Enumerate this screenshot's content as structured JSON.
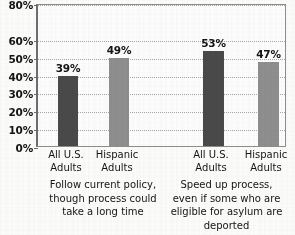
{
  "chart_data": {
    "type": "bar",
    "title": "",
    "subtitle": "",
    "xlabel": "",
    "ylabel": "",
    "ylim": [
      0,
      80
    ],
    "grid": true,
    "grid_style": "dotted-horizontal",
    "legend_position": "none",
    "value_suffix": "%",
    "categories": [
      "All U.S. Adults",
      "Hispanic Adults",
      "All U.S. Adults",
      "Hispanic Adults"
    ],
    "values": [
      39,
      49,
      53,
      47
    ],
    "bar_colors": [
      "#4a4a4a",
      "#8f8f8f",
      "#4a4a4a",
      "#8f8f8f"
    ],
    "data_labels": [
      "39%",
      "49%",
      "53%",
      "47%"
    ],
    "ytick_values": [
      0,
      10,
      20,
      30,
      40,
      50,
      60,
      80
    ],
    "ytick_labels": [
      "0%",
      "10%",
      "20%",
      "30%",
      "40%",
      "50%",
      "60%",
      "80%"
    ],
    "groups": [
      {
        "caption_lines": [
          "Follow current policy,",
          "though process could",
          "take a long time"
        ],
        "series": [
          {
            "name": "All U.S. Adults",
            "value": 39
          },
          {
            "name": "Hispanic Adults",
            "value": 49
          }
        ]
      },
      {
        "caption_lines": [
          "Speed up process,",
          "even if some who are",
          "eligible for asylum are",
          "deported"
        ],
        "series": [
          {
            "name": "All U.S. Adults",
            "value": 53
          },
          {
            "name": "Hispanic Adults",
            "value": 47
          }
        ]
      }
    ]
  },
  "axis": {
    "ticks": [
      {
        "label": "80%",
        "value": 80
      },
      {
        "label": "60%",
        "value": 60
      },
      {
        "label": "50%",
        "value": 50
      },
      {
        "label": "40%",
        "value": 40
      },
      {
        "label": "30%",
        "value": 30
      },
      {
        "label": "20%",
        "value": 20
      },
      {
        "label": "10%",
        "value": 10
      },
      {
        "label": "0%",
        "value": 0
      }
    ]
  },
  "bars": [
    {
      "label": "39%",
      "value": 39,
      "color": "#4a4a4a",
      "x": 56,
      "width": 20
    },
    {
      "label": "49%",
      "value": 49,
      "color": "#8f8f8f",
      "x": 107,
      "width": 20
    },
    {
      "label": "53%",
      "value": 53,
      "color": "#4a4a4a",
      "x": 201,
      "width": 21
    },
    {
      "label": "47%",
      "value": 47,
      "color": "#8f8f8f",
      "x": 256,
      "width": 21
    }
  ],
  "category_labels": [
    {
      "line1": "All U.S.",
      "line2": "Adults",
      "cx": 66
    },
    {
      "line1": "Hispanic",
      "line2": "Adults",
      "cx": 117
    },
    {
      "line1": "All U.S.",
      "line2": "Adults",
      "cx": 211
    },
    {
      "line1": "Hispanic",
      "line2": "Adults",
      "cx": 266
    }
  ],
  "captions": {
    "left": {
      "line1": "Follow current policy,",
      "line2": "though process could",
      "line3": "take a long time"
    },
    "right": {
      "line1": "Speed up process,",
      "line2": "even if some who are",
      "line3": "eligible for asylum are",
      "line4": "deported"
    }
  },
  "colors": {
    "bar_dark": "#4a4a4a",
    "bar_light": "#8f8f8f",
    "axis": "#6d6d6d",
    "gridline": "#a8a8a8",
    "text": "#141414",
    "background": "#fdfdfc"
  }
}
